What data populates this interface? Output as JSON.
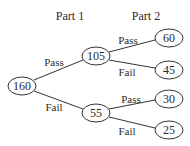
{
  "headers": {
    "part1": "Part 1",
    "part2": "Part 2"
  },
  "nodes": {
    "root": "160",
    "pass": "105",
    "fail": "55",
    "pass_pass": "60",
    "pass_fail": "45",
    "fail_pass": "30",
    "fail_fail": "25"
  },
  "edges": {
    "root_pass": "Pass",
    "root_fail": "Fail",
    "pass_pass": "Pass",
    "pass_fail": "Fail",
    "fail_pass": "Pass",
    "fail_fail": "Fail"
  }
}
